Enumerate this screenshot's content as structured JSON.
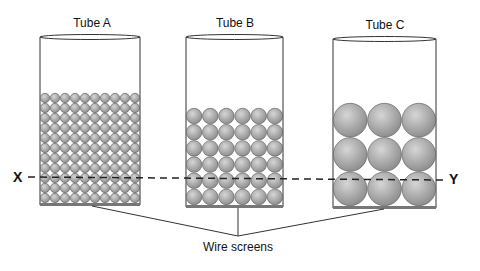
{
  "diagram": {
    "tubes": [
      {
        "label": "Tube A",
        "columns": 10,
        "rows": 11,
        "particle_size": "small"
      },
      {
        "label": "Tube B",
        "columns": 6,
        "rows": 6,
        "particle_size": "medium"
      },
      {
        "label": "Tube C",
        "columns": 3,
        "rows": 3,
        "particle_size": "large"
      }
    ],
    "line_left_label": "X",
    "line_right_label": "Y",
    "bottom_label": "Wire screens",
    "colors": {
      "particle_fill": "#a8a8a8",
      "particle_stroke": "#555555",
      "outline": "#333333"
    }
  }
}
